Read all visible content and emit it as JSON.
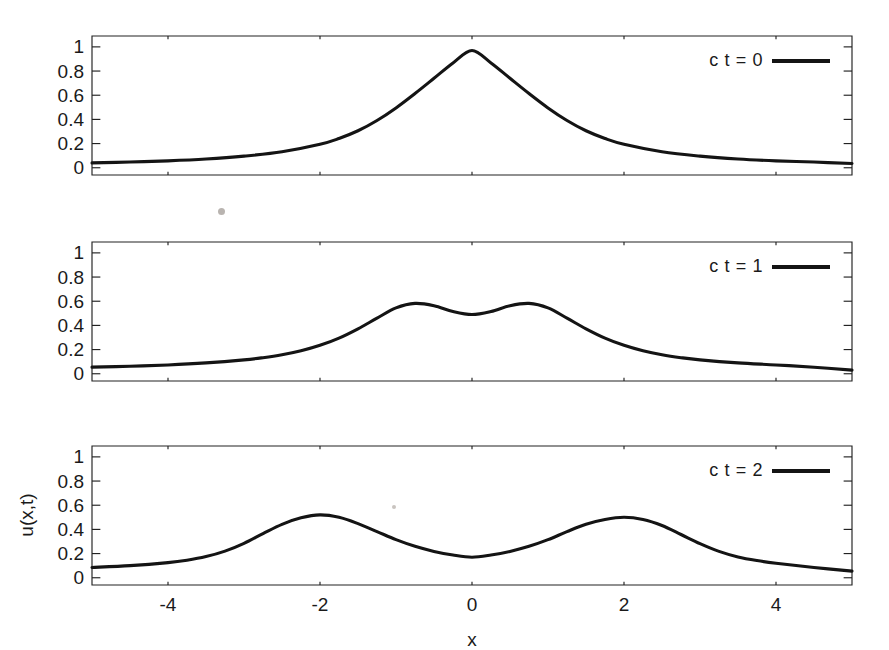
{
  "figure": {
    "xlabel": "x",
    "ylabel": "u(x,t)"
  },
  "axes": {
    "xticks": [
      "-4",
      "-2",
      "0",
      "2",
      "4"
    ],
    "xtick_values": [
      -4,
      -2,
      0,
      2,
      4
    ],
    "yticks": [
      "0",
      "0.2",
      "0.4",
      "0.6",
      "0.8",
      "1"
    ],
    "ytick_values": [
      0,
      0.2,
      0.4,
      0.6,
      0.8,
      1
    ]
  },
  "panels": [
    {
      "legend_label": "c t = 0"
    },
    {
      "legend_label": "c t = 1"
    },
    {
      "legend_label": "c t = 2"
    }
  ],
  "chart_data": {
    "type": "line",
    "title": "",
    "xlabel": "x",
    "ylabel": "u(x,t)",
    "xlim": [
      -5,
      5
    ],
    "ylim": [
      -0.06,
      1.09
    ],
    "grid": false,
    "legend_position": "upper right",
    "panel_layout": "3 stacked panels sharing x axis",
    "xticks": [
      -4,
      -2,
      0,
      2,
      4
    ],
    "yticks": [
      0,
      0.2,
      0.4,
      0.6,
      0.8,
      1
    ],
    "series": [
      {
        "name": "c t = 0",
        "panel": 0,
        "color": "#141414",
        "peaks": [
          {
            "x": 0,
            "y": 0.97
          }
        ],
        "edge_values": {
          "x_min": 0.04,
          "x_max": 0.035
        },
        "x": [
          -5,
          -4.5,
          -4,
          -3.5,
          -3,
          -2.5,
          -2,
          -1.75,
          -1.5,
          -1.25,
          -1,
          -0.75,
          -0.5,
          -0.25,
          0,
          0.25,
          0.5,
          0.75,
          1,
          1.25,
          1.5,
          1.75,
          2,
          2.5,
          3,
          3.5,
          4,
          4.5,
          5
        ],
        "y": [
          0.04,
          0.047,
          0.057,
          0.072,
          0.096,
          0.132,
          0.194,
          0.242,
          0.306,
          0.391,
          0.495,
          0.614,
          0.74,
          0.867,
          0.97,
          0.867,
          0.74,
          0.614,
          0.495,
          0.391,
          0.306,
          0.242,
          0.194,
          0.132,
          0.096,
          0.072,
          0.057,
          0.047,
          0.035
        ]
      },
      {
        "name": "c t = 1",
        "panel": 1,
        "color": "#141414",
        "peaks": [
          {
            "x": -1,
            "y": 0.58
          },
          {
            "x": 1,
            "y": 0.575
          }
        ],
        "valleys": [
          {
            "x": 0,
            "y": 0.49
          }
        ],
        "edge_values": {
          "x_min": 0.055,
          "x_max": 0.03
        },
        "x": [
          -5,
          -4.5,
          -4,
          -3.5,
          -3,
          -2.75,
          -2.5,
          -2.25,
          -2,
          -1.75,
          -1.5,
          -1.25,
          -1,
          -0.75,
          -0.5,
          -0.25,
          0,
          0.25,
          0.5,
          0.75,
          1,
          1.25,
          1.5,
          1.75,
          2,
          2.25,
          2.5,
          2.75,
          3,
          3.5,
          4,
          4.5,
          5
        ],
        "y": [
          0.055,
          0.062,
          0.073,
          0.09,
          0.115,
          0.133,
          0.157,
          0.19,
          0.235,
          0.295,
          0.372,
          0.46,
          0.545,
          0.582,
          0.563,
          0.515,
          0.49,
          0.515,
          0.563,
          0.582,
          0.545,
          0.46,
          0.372,
          0.295,
          0.235,
          0.19,
          0.157,
          0.133,
          0.115,
          0.09,
          0.073,
          0.054,
          0.03
        ]
      },
      {
        "name": "c t = 2",
        "panel": 2,
        "color": "#141414",
        "peaks": [
          {
            "x": -2,
            "y": 0.52
          },
          {
            "x": 2,
            "y": 0.5
          }
        ],
        "valleys": [
          {
            "x": 0,
            "y": 0.17
          }
        ],
        "edge_values": {
          "x_min": 0.085,
          "x_max": 0.055
        },
        "x": [
          -5,
          -4.5,
          -4,
          -3.75,
          -3.5,
          -3.25,
          -3,
          -2.75,
          -2.5,
          -2.25,
          -2,
          -1.75,
          -1.5,
          -1.25,
          -1,
          -0.75,
          -0.5,
          -0.25,
          0,
          0.25,
          0.5,
          0.75,
          1,
          1.25,
          1.5,
          1.75,
          2,
          2.25,
          2.5,
          2.75,
          3,
          3.25,
          3.5,
          3.75,
          4,
          4.5,
          5
        ],
        "y": [
          0.085,
          0.1,
          0.125,
          0.145,
          0.175,
          0.22,
          0.285,
          0.365,
          0.442,
          0.496,
          0.52,
          0.5,
          0.448,
          0.382,
          0.315,
          0.26,
          0.218,
          0.188,
          0.17,
          0.188,
          0.218,
          0.26,
          0.315,
          0.382,
          0.443,
          0.482,
          0.5,
          0.482,
          0.432,
          0.358,
          0.282,
          0.218,
          0.172,
          0.142,
          0.12,
          0.085,
          0.055
        ]
      }
    ]
  }
}
